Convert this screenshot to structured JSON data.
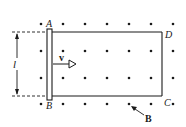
{
  "figure": {
    "labels": {
      "A": "A",
      "B_end": "B",
      "C": "C",
      "D": "D",
      "length": "l",
      "velocity": "v",
      "field": "B"
    },
    "colors": {
      "ink": "#1a1a1a",
      "background": "#ffffff"
    },
    "field_dots": {
      "rows_y": [
        24,
        51,
        78,
        104
      ],
      "cols_x": [
        41,
        63,
        85,
        107,
        129,
        151,
        173
      ]
    }
  }
}
